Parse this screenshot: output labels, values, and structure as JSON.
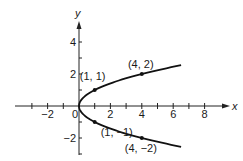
{
  "chart_data": {
    "type": "line",
    "title": "",
    "equation": "x = y^2",
    "xlabel": "x",
    "ylabel": "y",
    "xlim": [
      -3.5,
      9.5
    ],
    "ylim": [
      -3,
      5
    ],
    "x_ticks": [
      -3,
      -2,
      -1,
      1,
      2,
      3,
      4,
      5,
      6,
      7,
      8
    ],
    "x_tick_labels": [
      {
        "value": -2,
        "label": "−2"
      },
      {
        "value": 0,
        "label": "0"
      },
      {
        "value": 2,
        "label": "2"
      },
      {
        "value": 4,
        "label": "4"
      },
      {
        "value": 6,
        "label": "6"
      },
      {
        "value": 8,
        "label": "8"
      }
    ],
    "y_ticks": [
      -3,
      -2,
      -1,
      1,
      2,
      3,
      4
    ],
    "y_tick_labels": [
      {
        "value": 4,
        "label": "4"
      },
      {
        "value": 2,
        "label": "2"
      },
      {
        "value": -2,
        "label": "−2"
      }
    ],
    "grid": false,
    "series": [
      {
        "name": "parabola x = y^2",
        "color": "#111111",
        "y_range": [
          -2.55,
          2.55
        ],
        "points": [
          {
            "x": 0,
            "y": 0
          },
          {
            "x": 1,
            "y": 1
          },
          {
            "x": 4,
            "y": 2
          },
          {
            "x": 1,
            "y": -1
          },
          {
            "x": 4,
            "y": -2
          }
        ]
      }
    ],
    "annotations": [
      {
        "x": 1,
        "y": 1,
        "label": "(1, 1)"
      },
      {
        "x": 4,
        "y": 2,
        "label": "(4, 2)"
      },
      {
        "x": 1,
        "y": -1,
        "label": "(1, −1)"
      },
      {
        "x": 4,
        "y": -2,
        "label": "(4, −2)"
      }
    ]
  }
}
